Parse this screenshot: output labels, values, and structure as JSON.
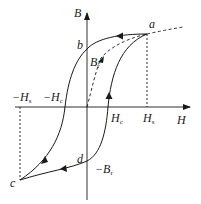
{
  "figure": {
    "type": "hysteresis-loop",
    "colors": {
      "stroke": "#1a1a1a",
      "background": "#ffffff"
    }
  },
  "axes": {
    "x_label": "H",
    "y_label": "B"
  },
  "points": {
    "a": "a",
    "b": "b",
    "c": "c",
    "d": "d"
  },
  "labels": {
    "Br": {
      "main": "B",
      "sub": "r"
    },
    "neg_Br": {
      "main": "−B",
      "sub": "r"
    },
    "Hc": {
      "main": "H",
      "sub": "c"
    },
    "neg_Hc": {
      "main": "−H",
      "sub": "c"
    },
    "Hs": {
      "main": "H",
      "sub": "s"
    },
    "neg_Hs": {
      "main": "−H",
      "sub": "s"
    }
  },
  "curves": [
    {
      "name": "initial-magnetization-curve",
      "style": "dashed",
      "from": "origin",
      "to": "a"
    },
    {
      "name": "saturation-extension",
      "style": "dashed",
      "from": "a",
      "to": "beyond"
    },
    {
      "name": "descending-branch",
      "style": "solid",
      "path": [
        "a",
        "b",
        "-Hc",
        "c"
      ]
    },
    {
      "name": "ascending-branch",
      "style": "solid",
      "path": [
        "c",
        "d",
        "Hc",
        "a"
      ]
    },
    {
      "name": "Hs-guide",
      "style": "dashed",
      "from": "a",
      "to": "H-axis"
    },
    {
      "name": "neg-Hs-guide",
      "style": "dashed",
      "from": "-Hs",
      "to": "c"
    }
  ]
}
